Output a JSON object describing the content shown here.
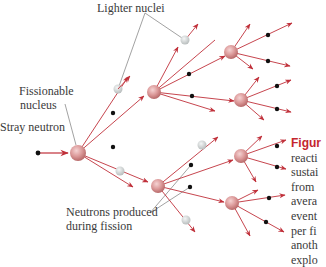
{
  "labels": {
    "lighter_nuclei": "Lighter nuclei",
    "fissionable_line1": "Fissionable",
    "fissionable_line2": "nucleus",
    "stray_neutron": "Stray neutron",
    "neutrons_line1": "Neutrons produced",
    "neutrons_line2": "during fission"
  },
  "caption": {
    "figure_label": "Figur",
    "lines": [
      "reacti",
      "sustai",
      "from",
      "avera",
      "event",
      "per fi",
      "anoth",
      "explo"
    ]
  },
  "colors": {
    "arrow": "#c0303a",
    "nucleus": "#d98a8a",
    "neutron": "#111111",
    "light_nucleus": "#d4d8d8",
    "pointer_line": "#8a8a8a",
    "caption_accent": "#c4262e"
  }
}
